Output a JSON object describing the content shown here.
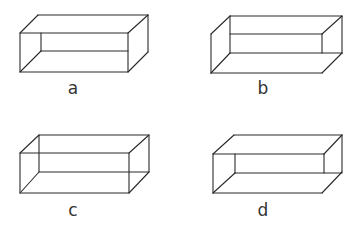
{
  "figure": {
    "boxes": [
      {
        "id": "a",
        "label": "a"
      },
      {
        "id": "b",
        "label": "b"
      },
      {
        "id": "c",
        "label": "c"
      },
      {
        "id": "d",
        "label": "d"
      }
    ]
  }
}
